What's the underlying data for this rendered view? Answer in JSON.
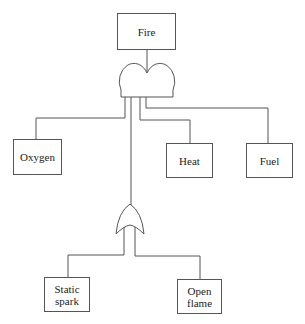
{
  "diagram": {
    "type": "fault-tree",
    "top_event": {
      "label": "Fire"
    },
    "and_gate": {
      "name": "AND",
      "inputs": [
        "Oxygen",
        "Heat",
        "Fuel",
        "OR gate"
      ]
    },
    "or_gate": {
      "name": "OR",
      "inputs": [
        "Static spark",
        "Open flame"
      ]
    },
    "nodes": {
      "fire": "Fire",
      "oxygen": "Oxygen",
      "heat": "Heat",
      "fuel": "Fuel",
      "static_spark_line1": "Static",
      "static_spark_line2": "spark",
      "open_flame_line1": "Open",
      "open_flame_line2": "flame"
    },
    "line_color": "#555555"
  }
}
